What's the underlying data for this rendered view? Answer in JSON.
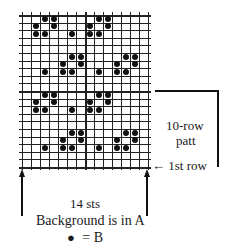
{
  "chart": {
    "columns": 14,
    "rows": 20,
    "repeat_rows": 10,
    "thick_column_line": 7,
    "dots_by_row_from_top": [
      [
        2,
        3,
        8,
        9
      ],
      [
        1,
        3,
        7,
        9
      ],
      [
        1,
        2,
        5,
        7,
        8
      ],
      [],
      [],
      [
        5,
        6,
        11,
        12
      ],
      [
        4,
        6,
        10,
        12
      ],
      [
        2,
        4,
        5,
        8,
        10,
        11
      ],
      [],
      [],
      [
        2,
        3,
        8,
        9
      ],
      [
        1,
        3,
        7,
        9
      ],
      [
        1,
        2,
        5,
        7,
        8
      ],
      [],
      [],
      [
        5,
        6,
        11,
        12
      ],
      [
        4,
        6,
        10,
        12
      ],
      [
        2,
        4,
        5,
        8,
        10,
        11
      ],
      [],
      []
    ]
  },
  "labels": {
    "stitches": "14 sts",
    "repeat_line1": "10-row",
    "repeat_line2": "patt",
    "first_row": "← 1st row",
    "background": "Background is in A",
    "legend_dot": "●",
    "legend_eq": "=  B"
  },
  "colors": {
    "grid": "#222222",
    "dot": "#111111",
    "background": "#ffffff"
  }
}
